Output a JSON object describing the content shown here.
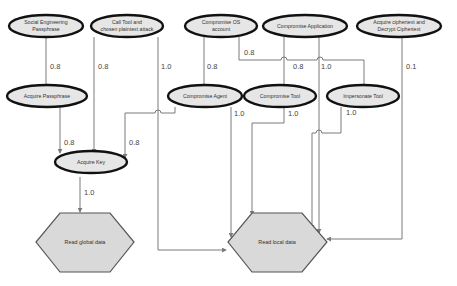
{
  "diagram": {
    "colors": {
      "node_fill": "#e6e6e6",
      "node_border": "#111111",
      "goal_fill": "#d9d9d9",
      "edge": "#7a7a7a"
    },
    "nodes": {
      "social_engineering": {
        "lines": [
          "Social Engineering",
          "Passphrase"
        ]
      },
      "call_tool": {
        "lines": [
          "Call Tool and",
          "chosen plaintext attack"
        ]
      },
      "compromise_os": {
        "lines": [
          "Compromise OS",
          "account"
        ]
      },
      "compromise_app": {
        "lines": [
          "Compromise Application"
        ]
      },
      "acquire_ciphertext": {
        "lines": [
          "Acquire ciphertext and",
          "Decrypt Ciphertext"
        ]
      },
      "acquire_passphrase": {
        "lines": [
          "Acquire Passphrase"
        ]
      },
      "compromise_agent": {
        "lines": [
          "Compromise Agent"
        ]
      },
      "compromise_tool": {
        "lines": [
          "Compromise Tool"
        ]
      },
      "impersonate_tool": {
        "lines": [
          "Impersonate Tool"
        ]
      },
      "acquire_key": {
        "lines": [
          "Acquire Key"
        ]
      },
      "read_global": {
        "lines": [
          "Read global data"
        ]
      },
      "read_local": {
        "lines": [
          "Read local data"
        ]
      }
    },
    "edges": [
      {
        "from": "social_engineering",
        "to": "acquire_passphrase",
        "label": "0.8"
      },
      {
        "from": "call_tool",
        "to": "acquire_key",
        "label": "0.8"
      },
      {
        "from": "acquire_passphrase",
        "to": "acquire_key",
        "label": "0.8"
      },
      {
        "from": "compromise_agent",
        "to": "acquire_key",
        "label": "0.8"
      },
      {
        "from": "call_tool",
        "to": "read_local",
        "label": "1.0"
      },
      {
        "from": "compromise_os",
        "to": "compromise_agent",
        "label": "0.8"
      },
      {
        "from": "compromise_os",
        "to": "impersonate_tool",
        "label": "0.8"
      },
      {
        "from": "compromise_app",
        "to": "compromise_tool",
        "label": "0.8"
      },
      {
        "from": "compromise_app",
        "to": "read_local",
        "label": "1.0"
      },
      {
        "from": "acquire_ciphertext",
        "to": "read_local",
        "label": "0.1"
      },
      {
        "from": "compromise_agent",
        "to": "read_local",
        "label": "1.0"
      },
      {
        "from": "compromise_tool",
        "to": "read_local",
        "label": "1.0"
      },
      {
        "from": "impersonate_tool",
        "to": "read_local",
        "label": "1.0"
      },
      {
        "from": "acquire_key",
        "to": "read_global",
        "label": "1.0"
      }
    ]
  }
}
